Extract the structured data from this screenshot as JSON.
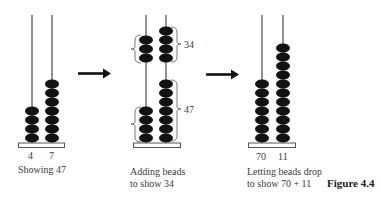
{
  "figure": {
    "title": "Figure 4.4",
    "colors": {
      "bead": "#111111",
      "rod": "#222222",
      "base_stroke": "#555555",
      "text": "#3a3a3a"
    }
  },
  "panels": [
    {
      "caption_lines": [
        "Showing 47"
      ],
      "rod_labels": [
        "4",
        "7"
      ],
      "rods": [
        {
          "beads": 4
        },
        {
          "beads": 7
        }
      ]
    },
    {
      "caption_lines": [
        "Adding beads",
        "to show 34"
      ],
      "rod_labels": [],
      "rods": [
        {
          "beads_bottom": 4,
          "beads_top": 3
        },
        {
          "beads_bottom": 7,
          "beads_top": 4
        }
      ],
      "brackets": [
        {
          "label": "34"
        },
        {
          "label": "47"
        }
      ]
    },
    {
      "caption_lines": [
        "Letting beads drop",
        "to show 70 + 11"
      ],
      "rod_labels": [
        "70",
        "11"
      ],
      "rods": [
        {
          "beads": 7
        },
        {
          "beads": 11
        }
      ]
    }
  ],
  "arrows": [
    {
      "direction": "right"
    },
    {
      "direction": "right"
    }
  ]
}
